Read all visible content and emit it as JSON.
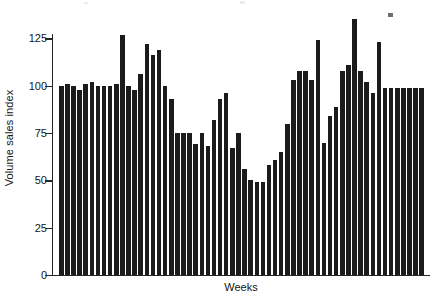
{
  "chart_data": {
    "type": "bar",
    "title": "",
    "subtitle": "",
    "xlabel": "Weeks",
    "ylabel": "Volume sales index",
    "ylim": [
      0,
      140
    ],
    "axis_max_drawn": 140,
    "yticks": [
      0,
      25,
      50,
      75,
      100,
      125
    ],
    "ytick_labels": [
      "0",
      "25",
      "50",
      "75",
      "100",
      "125"
    ],
    "grid": false,
    "legend": null,
    "bar_color": "#1b1b1b",
    "axis_color": "#262626",
    "background_color": "#ffffff",
    "categories": [
      "1",
      "2",
      "3",
      "4",
      "5",
      "6",
      "7",
      "8",
      "9",
      "10",
      "11",
      "12",
      "13",
      "14",
      "15",
      "16",
      "17",
      "18",
      "19",
      "20",
      "21",
      "22",
      "23",
      "24",
      "25",
      "26",
      "27",
      "28",
      "29",
      "30",
      "31",
      "32",
      "33",
      "34",
      "35",
      "36",
      "37",
      "38",
      "39",
      "40",
      "41",
      "42",
      "43",
      "44",
      "45",
      "46",
      "47",
      "48",
      "49",
      "50",
      "51",
      "52",
      "53",
      "54",
      "55",
      "56",
      "57",
      "58",
      "59",
      "60"
    ],
    "values": [
      100,
      101,
      100,
      98,
      101,
      102,
      100,
      100,
      100,
      101,
      127,
      100,
      98,
      106,
      122,
      116,
      119,
      100,
      93,
      75,
      75,
      75,
      69,
      75,
      68,
      82,
      93,
      96,
      67,
      75,
      56,
      50,
      49,
      49,
      58,
      61,
      65,
      80,
      103,
      108,
      108,
      103,
      124,
      70,
      84,
      89,
      108,
      111,
      135,
      108,
      102,
      96,
      123,
      99,
      99,
      99,
      99,
      99,
      99,
      99
    ],
    "values_note": "Volume sales index readings for consecutive weeks",
    "min_value": 49,
    "max_value": 135,
    "series_count": 1
  },
  "axis": {
    "y_title": "Volume sales index",
    "x_title": "Weeks"
  }
}
